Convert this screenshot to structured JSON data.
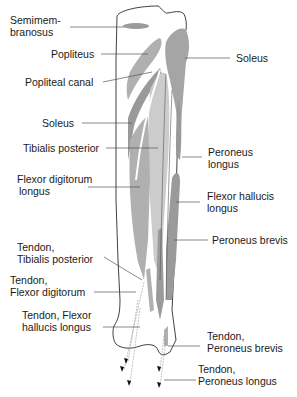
{
  "colors": {
    "background": "#ffffff",
    "bone_outline": "#2a2a2a",
    "muscle_dark": "#9a9a9a",
    "muscle_mid": "#b0b0b0",
    "muscle_light": "#cccccc",
    "leader_line": "#555555",
    "text": "#1a1a1a"
  },
  "labels": {
    "semimembranosus": {
      "line1": "Semimem-",
      "line2": "branosus"
    },
    "popliteus": {
      "line1": "Popliteus"
    },
    "popliteal_canal": {
      "line1": "Popliteal canal"
    },
    "soleus_left": {
      "line1": "Soleus"
    },
    "tibialis_posterior": {
      "line1": "Tibialis posterior"
    },
    "flexor_digitorum_longus": {
      "line1": "Flexor digitorum",
      "line2": "longus"
    },
    "tendon_tibialis_posterior": {
      "line1": "Tendon,",
      "line2": "Tibialis posterior"
    },
    "tendon_flexor_digitorum": {
      "line1": "Tendon,",
      "line2": "Flexor digitorum"
    },
    "tendon_flexor_hallucis_longus": {
      "line1": "Tendon, Flexor",
      "line2": "hallucis longus"
    },
    "soleus_right": {
      "line1": "Soleus"
    },
    "peroneus_longus": {
      "line1": "Peroneus",
      "line2": "longus"
    },
    "flexor_hallucis_longus": {
      "line1": "Flexor hallucis",
      "line2": "longus"
    },
    "peroneus_brevis": {
      "line1": "Peroneus brevis"
    },
    "tendon_peroneus_brevis": {
      "line1": "Tendon,",
      "line2": "Peroneus brevis"
    },
    "tendon_peroneus_longus": {
      "line1": "Tendon,",
      "line2": "Peroneus longus"
    }
  }
}
